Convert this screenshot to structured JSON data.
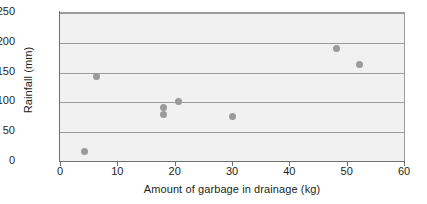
{
  "chart_data": {
    "type": "scatter",
    "title": "",
    "xlabel": "Amount of garbage in drainage (kg)",
    "ylabel": "Rainfall (mm)",
    "xlim": [
      0,
      60
    ],
    "ylim": [
      0,
      250
    ],
    "xticks": [
      0,
      10,
      20,
      30,
      40,
      50,
      60
    ],
    "yticks": [
      0,
      50,
      100,
      150,
      200,
      250
    ],
    "xtick_labels": [
      "0",
      "10",
      "20",
      "30",
      "40",
      "50",
      "60"
    ],
    "ytick_labels": [
      "0",
      "50",
      "100",
      "150",
      "200",
      "250"
    ],
    "grid": "horizontal",
    "legend": "none",
    "series": [
      {
        "name": "Rainfall vs garbage",
        "marker": "circle",
        "color": "#9a9a9a",
        "points": [
          {
            "x": 4.2,
            "y": 17
          },
          {
            "x": 6.3,
            "y": 143
          },
          {
            "x": 18.0,
            "y": 91
          },
          {
            "x": 18.0,
            "y": 79
          },
          {
            "x": 20.6,
            "y": 101
          },
          {
            "x": 30.0,
            "y": 77
          },
          {
            "x": 48.3,
            "y": 191
          },
          {
            "x": 52.2,
            "y": 163
          }
        ]
      }
    ],
    "style": {
      "plot_background": "#f1f1f1",
      "gridline_color": "#9b9b9b",
      "axis_color": "#6f6f6f",
      "text_color": "#231f20",
      "page_background": "#ffffff"
    }
  }
}
